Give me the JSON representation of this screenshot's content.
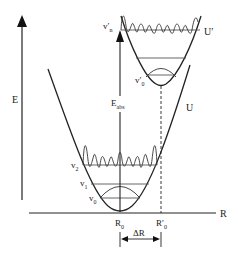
{
  "diagram": {
    "axes": {
      "y_label": "E",
      "x_label": "R"
    },
    "curves": [
      {
        "name": "ground-state",
        "label": "U",
        "levels": [
          "v0",
          "v1",
          "v2"
        ]
      },
      {
        "name": "excited-state",
        "label": "U′",
        "levels": [
          "v′0",
          "v′n"
        ]
      }
    ],
    "labels": {
      "E": "E",
      "R": "R",
      "U": "U",
      "U_prime": "U′",
      "E_abs_main": "E",
      "E_abs_sub": "abs",
      "v0": "v",
      "v0_sub": "0",
      "v1": "v",
      "v1_sub": "1",
      "v2": "v",
      "v2_sub": "2",
      "vp0": "v′",
      "vp0_sub": "0",
      "vpn": "v′",
      "vpn_sub": "n",
      "R0": "R",
      "R0_sub": "0",
      "Rp0": "R′",
      "Rp0_sub": "0",
      "deltaR": "ΔR"
    },
    "colors": {
      "line": "#222222",
      "level": "#555555",
      "background": "#ffffff"
    }
  }
}
